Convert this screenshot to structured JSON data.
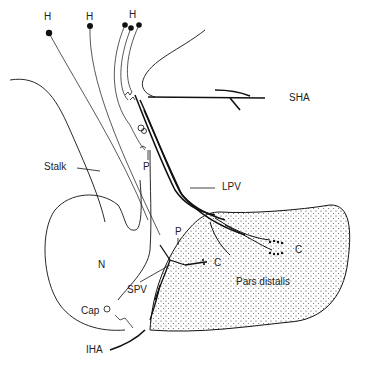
{
  "diagram": {
    "labels": {
      "h1": "H",
      "h2": "H",
      "h3": "H",
      "sha": "SHA",
      "stalk": "Stalk",
      "p_upper": "P",
      "lpv": "LPV",
      "p_lower": "P",
      "n": "N",
      "c_left": "C",
      "c_right": "C",
      "spv": "SPV",
      "pars_distalis": "Pars distalis",
      "cap": "Cap",
      "iha": "IHA"
    },
    "colors": {
      "line": "#111111",
      "stipple": "#333333",
      "background": "#ffffff"
    }
  }
}
